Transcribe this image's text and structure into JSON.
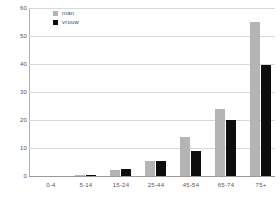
{
  "chart_data": {
    "type": "bar",
    "title": "",
    "xlabel": "",
    "ylabel": "",
    "grid": true,
    "legend_position": "top-left",
    "categories": [
      "0-4",
      "5-14",
      "15-24",
      "25-44",
      "45-54",
      "65-74",
      "75+"
    ],
    "ylim": [
      0,
      60
    ],
    "yticks": [
      0,
      10,
      20,
      30,
      40,
      50,
      60
    ],
    "series": [
      {
        "name": "man",
        "color": "#b4b4b4",
        "values": [
          0,
          0.3,
          2.0,
          5.5,
          14.0,
          24.0,
          55.0
        ]
      },
      {
        "name": "vrouw",
        "color": "#0d0d0d",
        "values": [
          0,
          0.5,
          2.5,
          5.5,
          9.0,
          20.0,
          39.5
        ]
      }
    ]
  },
  "legend": {
    "items": [
      {
        "label": "man",
        "swatch_name": "legend-swatch-man"
      },
      {
        "label": "vrouw",
        "swatch_name": "legend-swatch-vrouw"
      }
    ]
  }
}
